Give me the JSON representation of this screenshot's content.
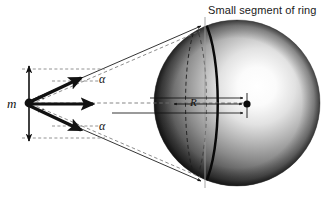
{
  "figure": {
    "background_color": "#ffffff",
    "width": 335,
    "height": 203,
    "title_label": "Small segment of ring",
    "mass_label": "m",
    "radius_label": "R",
    "angle_label_upper": "α",
    "angle_label_lower": "α",
    "line_color": "#111111",
    "sphere": {
      "center_x": 237,
      "center_y": 103,
      "radius": 83,
      "highlight_x": 268,
      "highlight_y": 85,
      "dark_color": "#1c1c1c",
      "mid_color": "#777777",
      "light_color": "#fdfdfd"
    },
    "ring_segment": {
      "description": "thick solid arc marking small segment of ring",
      "color": "#0d0d0d",
      "stroke_width": 2.4
    },
    "dashed_ellipse": {
      "description": "dashed great-circle arc behind ring segment",
      "color": "#181818"
    },
    "leader_line": {
      "description": "vertical leader from title label to ring top",
      "color": "#8a8a8a"
    },
    "mass_point": {
      "x": 29,
      "y": 103,
      "dot_radius": 4.2
    },
    "ring_point": {
      "x": 247,
      "y": 104,
      "dot_radius": 3.6
    },
    "vectors": [
      {
        "name": "upper-force-vector",
        "angle_deg": -22
      },
      {
        "name": "middle-force-vector",
        "angle_deg": 0
      },
      {
        "name": "lower-force-vector",
        "angle_deg": 22
      }
    ],
    "vertical_arrow": {
      "name": "vertical-double-arrow",
      "top_y": 64,
      "bottom_y": 142
    },
    "cone_lines": {
      "description": "solid sight lines from mass to ring top and bottom",
      "top_target_x": 204,
      "top_target_y": 27,
      "bottom_target_x": 204,
      "bottom_target_y": 181
    }
  }
}
